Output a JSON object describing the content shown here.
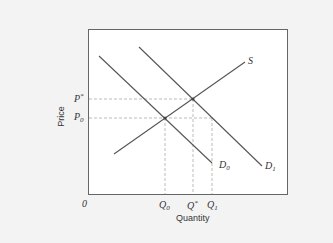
{
  "diagram": {
    "type": "supply-demand",
    "axes": {
      "x_label": "Quantity",
      "y_label": "Price",
      "origin_label": "0"
    },
    "curves": [
      {
        "id": "S",
        "label": "S",
        "kind": "supply"
      },
      {
        "id": "D0",
        "label": "D",
        "sub": "0",
        "kind": "demand"
      },
      {
        "id": "D1",
        "label": "D",
        "sub": "1",
        "kind": "demand"
      }
    ],
    "price_levels": [
      {
        "label": "P",
        "sup": "*"
      },
      {
        "label": "P",
        "sub": "0"
      }
    ],
    "quantity_levels": [
      {
        "label": "Q",
        "sub": "0"
      },
      {
        "label": "Q",
        "sup": "*"
      },
      {
        "label": "Q",
        "sub": "1"
      }
    ],
    "colors": {
      "background": "#f3f3f3",
      "plot_bg": "#ffffff",
      "line": "#555555",
      "dashed": "#aaaaaa"
    }
  }
}
